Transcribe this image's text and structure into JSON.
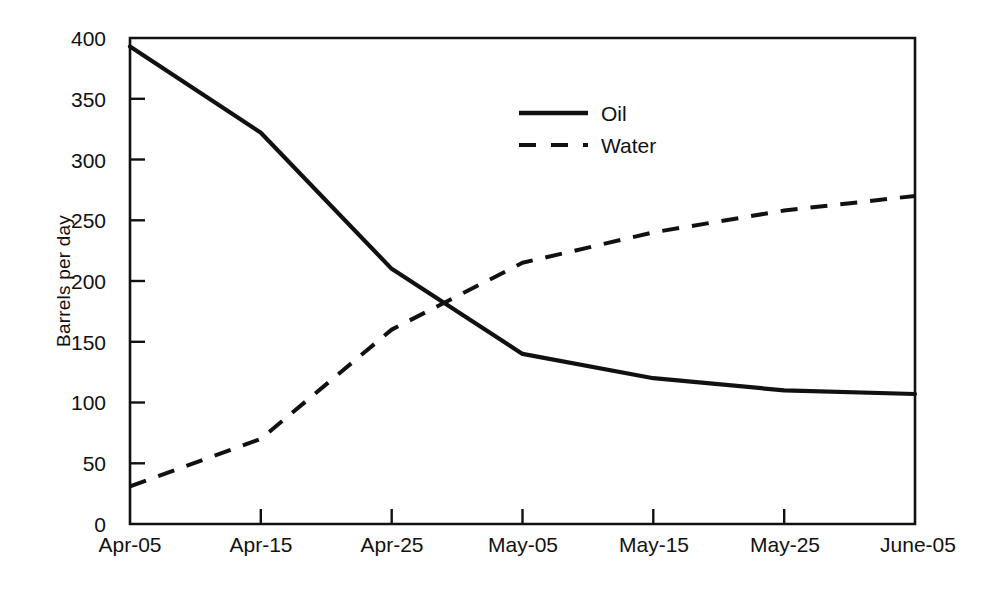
{
  "chart_data": {
    "type": "line",
    "title": "",
    "xlabel": "",
    "ylabel": "Barrels per day",
    "categories": [
      "Apr-05",
      "Apr-15",
      "Apr-25",
      "May-05",
      "May-15",
      "May-25",
      "June-05"
    ],
    "series": [
      {
        "name": "Oil",
        "style": "solid",
        "values": [
          393,
          322,
          210,
          140,
          120,
          110,
          107
        ]
      },
      {
        "name": "Water",
        "style": "dashed",
        "values": [
          31,
          70,
          160,
          215,
          240,
          258,
          270
        ]
      }
    ],
    "ylim": [
      0,
      400
    ],
    "ytick_values": [
      0,
      50,
      100,
      150,
      200,
      250,
      300,
      350,
      400
    ],
    "ytick_labels": [
      "0",
      "50",
      "100",
      "150",
      "200",
      "250",
      "300",
      "350",
      "400"
    ],
    "xtick_labels": [
      "Apr-05",
      "Apr-15",
      "Apr-25",
      "May-05",
      "May-15",
      "May-25",
      "June-05"
    ],
    "grid": false,
    "legend_position": "upper center",
    "legend_entries": [
      "Oil",
      "Water"
    ],
    "colors": {
      "oil": "#111111",
      "water": "#111111",
      "axis": "#111111",
      "background": "#ffffff"
    }
  },
  "axis": {
    "y_label": "Barrels per day",
    "y_ticks": [
      "0",
      "50",
      "100",
      "150",
      "200",
      "250",
      "300",
      "350",
      "400"
    ],
    "x_ticks": [
      "Apr-05",
      "Apr-15",
      "Apr-25",
      "May-05",
      "May-15",
      "May-25",
      "June-05"
    ]
  },
  "legend": {
    "oil_label": "Oil",
    "water_label": "Water"
  }
}
